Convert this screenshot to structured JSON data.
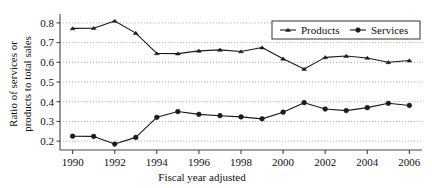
{
  "chart_data": {
    "type": "line",
    "title": "",
    "xlabel": "Fiscal year adjusted",
    "ylabel": "Ratio of services or products to total sales",
    "ylabel_line1": "Ratio of services or",
    "ylabel_line2": "products to total sales",
    "x": [
      1990,
      1991,
      1992,
      1993,
      1994,
      1995,
      1996,
      1997,
      1998,
      1999,
      2000,
      2001,
      2002,
      2003,
      2004,
      2005,
      2006
    ],
    "xtick_labels": [
      "1990",
      "1992",
      "1994",
      "1996",
      "1998",
      "2000",
      "2002",
      "2004",
      "2006"
    ],
    "xticks": [
      1990,
      1992,
      1994,
      1996,
      1998,
      2000,
      2002,
      2004,
      2006
    ],
    "ytick_labels": [
      "0.2",
      "0.3",
      "0.4",
      "0.5",
      "0.6",
      "0.7",
      "0.8"
    ],
    "yticks": [
      0.2,
      0.3,
      0.4,
      0.5,
      0.6,
      0.7,
      0.8
    ],
    "xlim": [
      1989.4,
      2006.6
    ],
    "ylim": [
      0.155,
      0.835
    ],
    "grid": true,
    "grid_axis": "y",
    "legend_position": "top-right",
    "series": [
      {
        "name": "Products",
        "marker": "triangle",
        "color": "#1a1a1a",
        "values": [
          0.772,
          0.773,
          0.81,
          0.748,
          0.645,
          0.644,
          0.658,
          0.663,
          0.655,
          0.675,
          0.618,
          0.566,
          0.625,
          0.632,
          0.622,
          0.6,
          0.609
        ]
      },
      {
        "name": "Services",
        "marker": "circle",
        "color": "#1a1a1a",
        "values": [
          0.225,
          0.224,
          0.185,
          0.219,
          0.321,
          0.35,
          0.336,
          0.329,
          0.323,
          0.313,
          0.347,
          0.395,
          0.363,
          0.355,
          0.37,
          0.392,
          0.381
        ]
      }
    ]
  },
  "legend": {
    "items": [
      {
        "label": "Products"
      },
      {
        "label": "Services"
      }
    ]
  },
  "colors": {
    "line": "#1a1a1a",
    "grid": "#9a9a9a",
    "axis": "#444444",
    "background": "#ffffff"
  }
}
